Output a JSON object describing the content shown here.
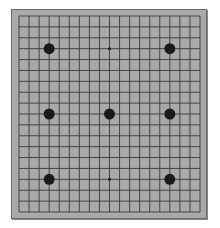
{
  "board": {
    "size": 19,
    "background": "#a9a9a9",
    "line_color": "#3a3a3a",
    "stone_color": "#1a1a1a",
    "grid": {
      "x0": 19,
      "y0": 16,
      "x1": 200,
      "y1": 212
    },
    "stones": [
      {
        "col": 3,
        "row": 3,
        "color": "black"
      },
      {
        "col": 15,
        "row": 3,
        "color": "black"
      },
      {
        "col": 3,
        "row": 9,
        "color": "black"
      },
      {
        "col": 9,
        "row": 9,
        "color": "black"
      },
      {
        "col": 15,
        "row": 9,
        "color": "black"
      },
      {
        "col": 3,
        "row": 15,
        "color": "black"
      },
      {
        "col": 15,
        "row": 15,
        "color": "black"
      }
    ],
    "star_points": [
      {
        "col": 9,
        "row": 3
      },
      {
        "col": 9,
        "row": 15
      }
    ]
  }
}
